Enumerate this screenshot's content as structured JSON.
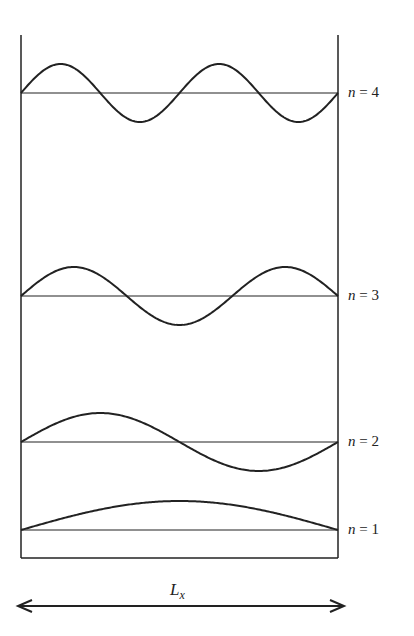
{
  "diagram": {
    "title": "",
    "box": {
      "left": 21,
      "right": 338,
      "top": 35,
      "bottom": 558
    },
    "modes": [
      {
        "n": 4,
        "label_var": "n",
        "label_eq": " = ",
        "label_val": "4",
        "baseline_y": 93,
        "amplitude": 29
      },
      {
        "n": 3,
        "label_var": "n",
        "label_eq": " = ",
        "label_val": "3",
        "baseline_y": 296,
        "amplitude": 29
      },
      {
        "n": 2,
        "label_var": "n",
        "label_eq": " = ",
        "label_val": "2",
        "baseline_y": 442,
        "amplitude": 29
      },
      {
        "n": 1,
        "label_var": "n",
        "label_eq": " = ",
        "label_val": "1",
        "baseline_y": 530,
        "amplitude": 29
      }
    ],
    "dimension": {
      "label_main": "L",
      "label_sub": "x",
      "y": 606,
      "x1": 18,
      "x2": 344
    },
    "stroke_color": "#222222"
  }
}
